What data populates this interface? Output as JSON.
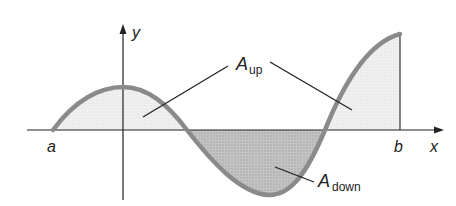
{
  "diagram": {
    "axes": {
      "x_label": "x",
      "y_label": "y"
    },
    "bounds": {
      "lower_label": "a",
      "upper_label": "b"
    },
    "regions": [
      {
        "id": "up",
        "label_main": "A",
        "label_sub": "up",
        "description": "area above x-axis"
      },
      {
        "id": "down",
        "label_main": "A",
        "label_sub": "down",
        "description": "area below x-axis"
      }
    ],
    "colors": {
      "curve": "#8a8a8a",
      "fill_up": "#ececec",
      "fill_down": "#b8b8b8",
      "axis": "#222222"
    }
  }
}
